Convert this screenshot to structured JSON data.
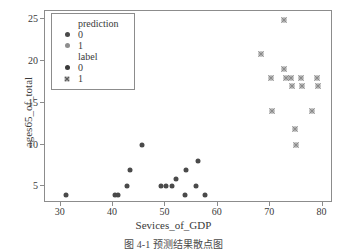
{
  "chart_data": {
    "type": "scatter",
    "title": "",
    "xlabel": "Sevices_of_GDP",
    "ylabel": "ages65_of_total",
    "xlim": [
      27,
      82
    ],
    "ylim": [
      3,
      26
    ],
    "xticks": [
      30,
      40,
      50,
      60,
      70,
      80
    ],
    "yticks": [
      5,
      10,
      15,
      20,
      25
    ],
    "grid": false,
    "legend_position": "upper-left",
    "legend": {
      "groups": [
        {
          "title": "prediction",
          "entries": [
            {
              "label": "0",
              "marker": "circle",
              "color": "#4a4a4a"
            },
            {
              "label": "1",
              "marker": "circle",
              "color": "#8e8e8e"
            }
          ]
        },
        {
          "title": "label",
          "entries": [
            {
              "label": "0",
              "marker": "circle",
              "color": "#3a3a3a"
            },
            {
              "label": "1",
              "marker": "cross",
              "color": "#5a5a5a"
            }
          ]
        }
      ]
    },
    "series": [
      {
        "name": "label 0",
        "marker": "circle",
        "color": "#4a4a4a",
        "points": [
          {
            "x": 31.0,
            "y": 4.0
          },
          {
            "x": 40.4,
            "y": 4.0
          },
          {
            "x": 41.0,
            "y": 4.0
          },
          {
            "x": 42.7,
            "y": 5.0
          },
          {
            "x": 43.2,
            "y": 7.0
          },
          {
            "x": 45.6,
            "y": 10.0
          },
          {
            "x": 49.2,
            "y": 5.0
          },
          {
            "x": 50.2,
            "y": 5.0
          },
          {
            "x": 51.2,
            "y": 5.0
          },
          {
            "x": 52.1,
            "y": 5.9
          },
          {
            "x": 53.8,
            "y": 4.0
          },
          {
            "x": 53.9,
            "y": 7.0
          },
          {
            "x": 55.9,
            "y": 5.0
          },
          {
            "x": 56.2,
            "y": 8.0
          },
          {
            "x": 57.5,
            "y": 4.0
          }
        ]
      },
      {
        "name": "label 1",
        "marker": "cross",
        "color": "#8a8a8a",
        "points": [
          {
            "x": 68.2,
            "y": 20.9
          },
          {
            "x": 70.1,
            "y": 18.0
          },
          {
            "x": 70.4,
            "y": 14.0
          },
          {
            "x": 72.7,
            "y": 24.9
          },
          {
            "x": 72.6,
            "y": 19.0
          },
          {
            "x": 73.0,
            "y": 18.0
          },
          {
            "x": 74.0,
            "y": 18.0
          },
          {
            "x": 74.2,
            "y": 17.0
          },
          {
            "x": 74.8,
            "y": 11.9
          },
          {
            "x": 74.9,
            "y": 10.0
          },
          {
            "x": 75.9,
            "y": 18.0
          },
          {
            "x": 76.1,
            "y": 17.0
          },
          {
            "x": 78.0,
            "y": 14.0
          },
          {
            "x": 78.9,
            "y": 18.0
          },
          {
            "x": 79.1,
            "y": 17.0
          }
        ]
      }
    ]
  },
  "caption": {
    "text": "图 4-1   预测结果散点图"
  }
}
